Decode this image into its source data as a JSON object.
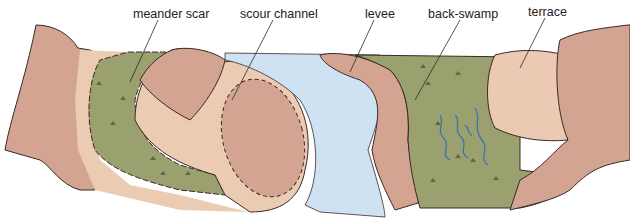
{
  "diagram": {
    "labels": [
      {
        "id": "meander-scar",
        "text": "meander scar",
        "x": 133,
        "y": 7
      },
      {
        "id": "scour-channel",
        "text": "scour channel",
        "x": 240,
        "y": 7
      },
      {
        "id": "levee",
        "text": "levee",
        "x": 365,
        "y": 7
      },
      {
        "id": "back-swamp",
        "text": "back-swamp",
        "x": 428,
        "y": 7
      },
      {
        "id": "terrace",
        "text": "terrace",
        "x": 528,
        "y": 5
      }
    ],
    "colors": {
      "bluff": "#d4a493",
      "bluff_dark": "#c99887",
      "terrace": "#ecc9b2",
      "sand": "#eccbb3",
      "floodplain": "#9aa06e",
      "water": "#cfe2f3",
      "stream": "#3b6fb5",
      "line": "#3a2a26",
      "background": "#ffffff"
    }
  }
}
